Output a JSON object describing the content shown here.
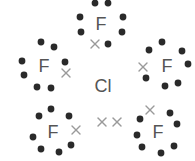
{
  "colors": {
    "dot": "#2a2a2a",
    "cross": "#9a9a9a",
    "label": "#555555"
  },
  "central_atom": {
    "symbol": "Cl",
    "x": 103,
    "y": 92
  },
  "lone_pair_crosses": [
    {
      "x": 102,
      "y": 122
    },
    {
      "x": 117,
      "y": 122
    }
  ],
  "fluorines": [
    {
      "symbol": "F",
      "x": 101,
      "y": 30,
      "dots": [
        [
          95,
          3
        ],
        [
          108,
          3
        ],
        [
          80,
          17
        ],
        [
          81,
          32
        ],
        [
          123,
          17
        ],
        [
          122,
          32
        ],
        [
          108,
          44
        ]
      ],
      "cross": [
        95,
        44
      ]
    },
    {
      "symbol": "F",
      "x": 44,
      "y": 72,
      "dots": [
        [
          41,
          42
        ],
        [
          54,
          47
        ],
        [
          22,
          61
        ],
        [
          24,
          75
        ],
        [
          65,
          62
        ],
        [
          37,
          87
        ],
        [
          51,
          88
        ]
      ],
      "cross": [
        66,
        73
      ]
    },
    {
      "symbol": "F",
      "x": 167,
      "y": 72,
      "dots": [
        [
          149,
          50
        ],
        [
          162,
          42
        ],
        [
          182,
          51
        ],
        [
          188,
          64
        ],
        [
          146,
          78
        ],
        [
          165,
          86
        ],
        [
          178,
          83
        ]
      ],
      "cross": [
        143,
        67
      ]
    },
    {
      "symbol": "F",
      "x": 53,
      "y": 138,
      "dots": [
        [
          39,
          116
        ],
        [
          51,
          109
        ],
        [
          69,
          116
        ],
        [
          33,
          137
        ],
        [
          41,
          149
        ],
        [
          59,
          152
        ],
        [
          71,
          145
        ]
      ],
      "cross": [
        76,
        130
      ]
    },
    {
      "symbol": "F",
      "x": 158,
      "y": 138,
      "dots": [
        [
          140,
          119
        ],
        [
          170,
          113
        ],
        [
          177,
          124
        ],
        [
          137,
          135
        ],
        [
          142,
          147
        ],
        [
          161,
          153
        ],
        [
          174,
          146
        ]
      ],
      "cross": [
        150,
        110
      ]
    }
  ]
}
